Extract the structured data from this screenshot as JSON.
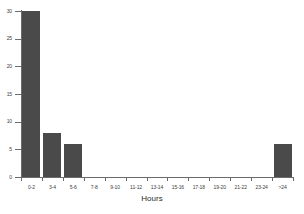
{
  "chart_data": {
    "type": "bar",
    "title": "",
    "subtitle": "",
    "xlabel": "Hours",
    "ylabel": "",
    "categories": [
      "0-2",
      "3-4",
      "5-6",
      "7-8",
      "9-10",
      "11-12",
      "13-14",
      "15-16",
      "17-18",
      "19-20",
      "21-22",
      "23-24",
      ">24"
    ],
    "values": [
      30,
      8,
      6,
      0,
      0,
      0,
      0,
      0,
      0,
      0,
      0,
      0,
      6
    ],
    "series": [
      {
        "name": "count",
        "values": [
          30,
          8,
          6,
          0,
          0,
          0,
          0,
          0,
          0,
          0,
          0,
          0,
          6
        ]
      }
    ],
    "ylim": [
      0,
      30
    ],
    "yticks": [
      0,
      5,
      10,
      15,
      20,
      25,
      30
    ],
    "ytick_labels": [
      "0",
      "5",
      "10",
      "15",
      "20",
      "25",
      "30"
    ],
    "grid": false,
    "legend": false,
    "legend_position": "none",
    "bar_color": "#4a4a4a",
    "axis_color": "#6b6b6b",
    "text_color": "#3c3c3c",
    "background": "#ffffff"
  }
}
